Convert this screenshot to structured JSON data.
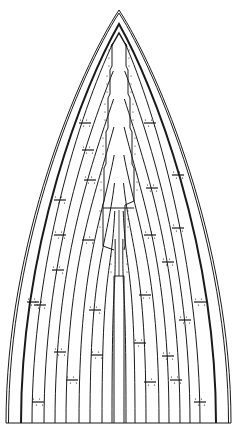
{
  "diagram": {
    "title": "",
    "width": 237,
    "height": 430,
    "colors": {
      "background": "#ffffff",
      "line": "#1a1a1a",
      "seam": "#333333"
    },
    "apex": {
      "x": 119,
      "y": 10
    },
    "inner_apex": {
      "x": 119,
      "y": 33
    },
    "base_y": 423,
    "outer_edge": {
      "left_x": 6,
      "right_x": 231
    },
    "sheer_line": {
      "left_x": 21,
      "right_x": 216,
      "apex_y": 24
    },
    "strake_bottoms_left": [
      32,
      44,
      55,
      66,
      79,
      90,
      102,
      112
    ],
    "strake_bottoms_right": [
      126,
      135,
      146,
      159,
      169,
      180,
      190,
      200
    ],
    "butt_joints": [
      {
        "x": 38,
        "y": 402
      },
      {
        "x": 60,
        "y": 352
      },
      {
        "x": 72,
        "y": 380
      },
      {
        "x": 97,
        "y": 355
      },
      {
        "x": 40,
        "y": 305
      },
      {
        "x": 58,
        "y": 270
      },
      {
        "x": 88,
        "y": 240
      },
      {
        "x": 95,
        "y": 310
      },
      {
        "x": 33,
        "y": 302
      },
      {
        "x": 60,
        "y": 200
      },
      {
        "x": 90,
        "y": 180
      },
      {
        "x": 85,
        "y": 123
      },
      {
        "x": 88,
        "y": 150
      },
      {
        "x": 60,
        "y": 235
      },
      {
        "x": 150,
        "y": 382
      },
      {
        "x": 140,
        "y": 343
      },
      {
        "x": 168,
        "y": 356
      },
      {
        "x": 185,
        "y": 320
      },
      {
        "x": 200,
        "y": 302
      },
      {
        "x": 176,
        "y": 380
      },
      {
        "x": 150,
        "y": 235
      },
      {
        "x": 178,
        "y": 228
      },
      {
        "x": 168,
        "y": 262
      },
      {
        "x": 152,
        "y": 188
      },
      {
        "x": 178,
        "y": 175
      },
      {
        "x": 150,
        "y": 123
      },
      {
        "x": 145,
        "y": 295
      },
      {
        "x": 200,
        "y": 402
      }
    ],
    "keel_steps_left": [
      {
        "y": 44,
        "x": 112
      },
      {
        "y": 70,
        "x": 110
      },
      {
        "y": 98,
        "x": 108
      },
      {
        "y": 132,
        "x": 106
      },
      {
        "y": 168,
        "x": 104
      },
      {
        "y": 205,
        "x": 103
      },
      {
        "y": 250,
        "x": 114
      }
    ],
    "keel_steps_right": [
      {
        "y": 44,
        "x": 126
      },
      {
        "y": 70,
        "x": 128
      },
      {
        "y": 98,
        "x": 130
      },
      {
        "y": 132,
        "x": 132
      },
      {
        "y": 168,
        "x": 134
      },
      {
        "y": 205,
        "x": 125
      },
      {
        "y": 250,
        "x": 124
      }
    ],
    "center_plank": {
      "x1": 114,
      "x2": 124,
      "top_y": 276,
      "bottom_y": 423
    }
  }
}
